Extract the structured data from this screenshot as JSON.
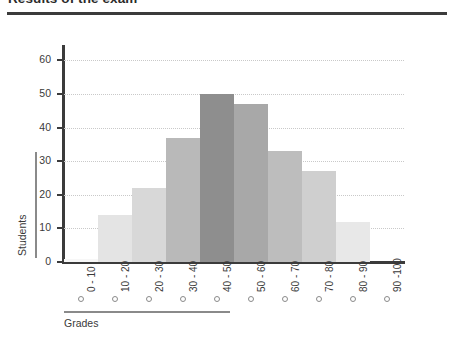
{
  "title": "Results of the exam",
  "axis_titles": {
    "y": "Students",
    "x": "Grades"
  },
  "chart_data": {
    "type": "bar",
    "title": "Results of the exam",
    "xlabel": "Grades",
    "ylabel": "Students",
    "categories": [
      "0 - 10",
      "10 - 20",
      "20 - 30",
      "30 - 40",
      "40 - 50",
      "50 - 60",
      "60 - 70",
      "70 - 80",
      "80 - 90",
      "90 -100"
    ],
    "values": [
      1,
      14,
      22,
      37,
      50,
      47,
      33,
      27,
      12,
      0
    ],
    "bar_colors": [
      "#f7f7f7",
      "#e4e4e4",
      "#d8d8d8",
      "#b9b9b9",
      "#8e8e8e",
      "#a8a8a8",
      "#bdbdbd",
      "#cfcfcf",
      "#e8e8e8",
      "#fafafa"
    ],
    "ylim": [
      0,
      64
    ],
    "yticks": [
      0,
      10,
      20,
      30,
      40,
      50,
      60
    ],
    "ytick_labels": [
      "0",
      "10",
      "20",
      "30",
      "40",
      "50",
      "60"
    ],
    "grid": true,
    "grid_style": "dotted",
    "legend": "none"
  },
  "colors": {
    "axis": "#3b3b3b",
    "grid": "#c9c9c9",
    "text": "#3a3a3a",
    "rule": "#8a8a8a"
  }
}
